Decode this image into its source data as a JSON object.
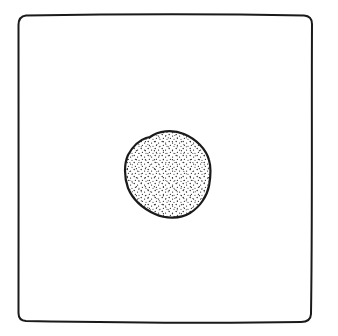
{
  "diagram": {
    "description": "Hand-drawn square frame containing a single stippled circular blob at its center",
    "background_color": "#ffffff",
    "ink_color": "#1a1a1a",
    "frame": {
      "x": 18,
      "y": 15,
      "width": 294,
      "height": 308,
      "corner_radius": 8
    },
    "circle": {
      "cx": 168,
      "cy": 174,
      "rx": 43,
      "ry": 44,
      "fill": "stippled"
    },
    "labels": []
  }
}
